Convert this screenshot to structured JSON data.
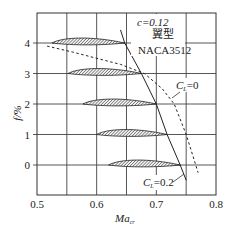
{
  "chart_data": {
    "type": "line",
    "title": "",
    "xlabel": "Ma",
    "xlabel_sub": "cr",
    "ylabel": "f/%",
    "xlim": [
      0.5,
      0.8
    ],
    "ylim": [
      -1,
      5
    ],
    "xticks": [
      "0.5",
      "0.6",
      "0.7",
      "0.8"
    ],
    "yticks": [
      "0",
      "1",
      "2",
      "3",
      "4"
    ],
    "grid": true,
    "annotations": {
      "thickness": "c=0.12",
      "airfoil_label": "翼型",
      "airfoil_name": "NACA3512",
      "cl0_label": "C",
      "cl0_sub": "L",
      "cl0_value": "=0",
      "cl02_label": "C",
      "cl02_sub": "L",
      "cl02_value": "=0.2"
    },
    "series": [
      {
        "name": "C_L=0.2",
        "style": "solid",
        "x": [
          0.64,
          0.647,
          0.675,
          0.7,
          0.718,
          0.74,
          0.75
        ],
        "y": [
          4.43,
          4.0,
          3.0,
          2.0,
          1.0,
          0.0,
          -0.5
        ]
      },
      {
        "name": "C_L=0",
        "style": "dashed",
        "x": [
          0.517,
          0.56,
          0.6,
          0.64,
          0.68,
          0.71,
          0.73,
          0.75,
          0.77
        ],
        "y": [
          3.9,
          3.7,
          3.5,
          3.3,
          3.0,
          2.5,
          2.0,
          1.0,
          -0.25
        ]
      }
    ],
    "airfoils": [
      {
        "f": 4,
        "x_start": 0.525,
        "x_end": 0.647
      },
      {
        "f": 3,
        "x_start": 0.552,
        "x_end": 0.675
      },
      {
        "f": 2,
        "x_start": 0.577,
        "x_end": 0.7
      },
      {
        "f": 1,
        "x_start": 0.6,
        "x_end": 0.718
      },
      {
        "f": 0,
        "x_start": 0.62,
        "x_end": 0.74
      }
    ]
  }
}
